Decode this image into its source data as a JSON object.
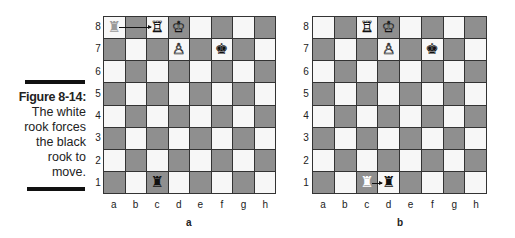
{
  "caption": {
    "figure_label": "Figure 8-14:",
    "lines": [
      "The white",
      "rook forces",
      "the black",
      "rook to",
      "move."
    ]
  },
  "colors": {
    "light_square": "#f7f7f7",
    "dark_square": "#8f8f8f",
    "bar": "#111111"
  },
  "files": [
    "a",
    "b",
    "c",
    "d",
    "e",
    "f",
    "g",
    "h"
  ],
  "ranks": [
    "8",
    "7",
    "6",
    "5",
    "4",
    "3",
    "2",
    "1"
  ],
  "boards": [
    {
      "label": "a",
      "pieces": [
        {
          "square": "a8",
          "piece": "rook",
          "color": "ghost-gray",
          "glyph": "♜"
        },
        {
          "square": "c8",
          "piece": "rook",
          "color": "white",
          "glyph": "♖"
        },
        {
          "square": "d8",
          "piece": "king",
          "color": "white",
          "glyph": "♔"
        },
        {
          "square": "d7",
          "piece": "pawn",
          "color": "white",
          "glyph": "♙"
        },
        {
          "square": "f7",
          "piece": "king",
          "color": "black",
          "glyph": "♚"
        },
        {
          "square": "c1",
          "piece": "rook",
          "color": "black",
          "glyph": "♜"
        }
      ],
      "arrows": [
        {
          "from": "a8",
          "to": "c8"
        }
      ]
    },
    {
      "label": "b",
      "pieces": [
        {
          "square": "c8",
          "piece": "rook",
          "color": "white",
          "glyph": "♖"
        },
        {
          "square": "d8",
          "piece": "king",
          "color": "white",
          "glyph": "♔"
        },
        {
          "square": "d7",
          "piece": "pawn",
          "color": "white",
          "glyph": "♙"
        },
        {
          "square": "f7",
          "piece": "king",
          "color": "black",
          "glyph": "♚"
        },
        {
          "square": "c1",
          "piece": "rook",
          "color": "ghost-white",
          "glyph": "♜"
        },
        {
          "square": "d1",
          "piece": "rook",
          "color": "black",
          "glyph": "♜"
        }
      ],
      "arrows": [
        {
          "from": "c1",
          "to": "d1"
        }
      ]
    }
  ]
}
